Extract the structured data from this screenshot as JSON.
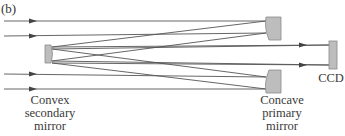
{
  "figure": {
    "panel_label": "(b)",
    "labels": {
      "secondary_line1": "Convex",
      "secondary_line2": "secondary",
      "secondary_line3": "mirror",
      "primary_line1": "Concave",
      "primary_line2": "primary",
      "primary_line3": "mirror",
      "detector": "CCD"
    },
    "colors": {
      "ray": "#555555",
      "mirror_fill": "#bdbdbd",
      "mirror_stroke": "#8a8a8a",
      "text": "#3a3a3a"
    },
    "components": [
      "convex-secondary-mirror",
      "concave-primary-mirror-upper",
      "concave-primary-mirror-lower",
      "ccd-detector"
    ],
    "incoming_rays": 4
  }
}
